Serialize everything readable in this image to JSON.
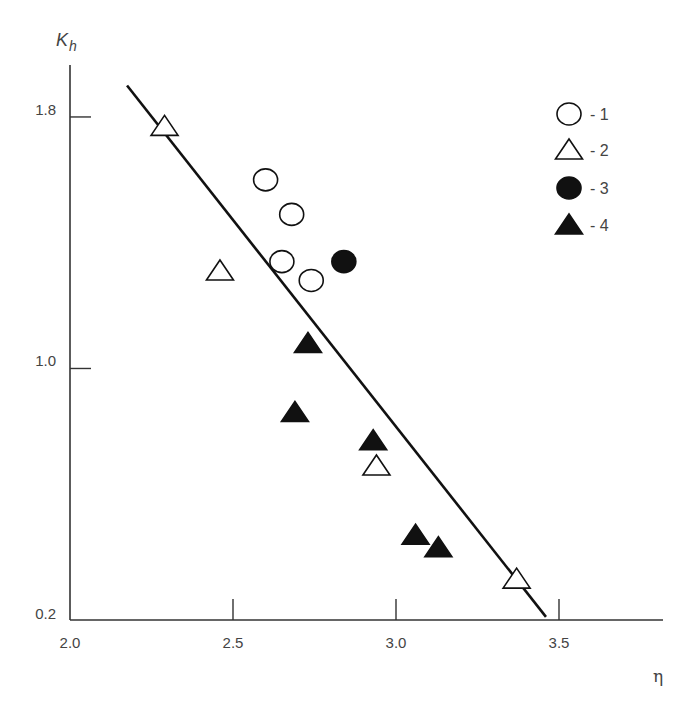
{
  "chart_data": {
    "type": "scatter",
    "title": "",
    "xlabel": "η",
    "ylabel": "K_h",
    "ylabel_main": "K",
    "ylabel_sub": "h",
    "xlim": [
      2.0,
      3.8
    ],
    "ylim": [
      0.2,
      1.95
    ],
    "xticks": [
      2.0,
      2.5,
      3.0,
      3.5
    ],
    "xtick_labels": [
      "2.0",
      "2.5",
      "3.0",
      "3.5"
    ],
    "yticks": [
      0.2,
      1.0,
      1.8
    ],
    "ytick_labels": [
      "0.2",
      "1.0",
      "1.8"
    ],
    "grid": false,
    "legend_position": "upper right",
    "series": [
      {
        "name": "1",
        "legend_label": "- 1",
        "marker": "circle",
        "filled": false,
        "points": [
          {
            "x": 2.6,
            "y": 1.6
          },
          {
            "x": 2.68,
            "y": 1.49
          },
          {
            "x": 2.65,
            "y": 1.34
          },
          {
            "x": 2.74,
            "y": 1.28
          }
        ]
      },
      {
        "name": "2",
        "legend_label": "- 2",
        "marker": "triangle",
        "filled": false,
        "points": [
          {
            "x": 2.29,
            "y": 1.77
          },
          {
            "x": 2.46,
            "y": 1.31
          },
          {
            "x": 2.94,
            "y": 0.69
          },
          {
            "x": 3.37,
            "y": 0.33
          }
        ]
      },
      {
        "name": "3",
        "legend_label": "- 3",
        "marker": "circle",
        "filled": true,
        "points": [
          {
            "x": 2.84,
            "y": 1.34
          }
        ]
      },
      {
        "name": "4",
        "legend_label": "- 4",
        "marker": "triangle",
        "filled": true,
        "points": [
          {
            "x": 2.73,
            "y": 1.08
          },
          {
            "x": 2.69,
            "y": 0.86
          },
          {
            "x": 2.93,
            "y": 0.77
          },
          {
            "x": 3.06,
            "y": 0.47
          },
          {
            "x": 3.13,
            "y": 0.43
          }
        ]
      }
    ],
    "fit_line": {
      "start": {
        "x": 2.175,
        "y": 1.9
      },
      "end": {
        "x": 3.46,
        "y": 0.21
      }
    }
  },
  "colors": {
    "axis": "#333333",
    "line": "#111111",
    "marker_fill": "#111111",
    "marker_open_fill": "#ffffff",
    "text": "#444444"
  }
}
